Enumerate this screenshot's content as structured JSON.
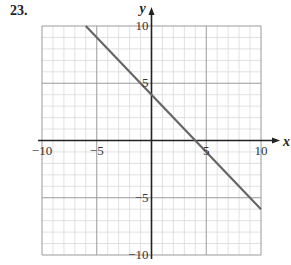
{
  "problem_number": "23.",
  "colors": {
    "minor_grid": "#d9d9d9",
    "major_grid": "#9a9a9a",
    "axis": "#222222",
    "line": "#666666"
  },
  "chart_data": {
    "type": "line",
    "title": "",
    "xlabel": "x",
    "ylabel": "y",
    "xlim": [
      -10,
      10
    ],
    "ylim": [
      -10,
      10
    ],
    "grid": true,
    "grid_minor_step": 1,
    "grid_major_step": 5,
    "x_ticks": [
      -10,
      -5,
      5,
      10
    ],
    "y_ticks": [
      -10,
      -5,
      5,
      10
    ],
    "x_tick_labels": [
      "−10",
      "−5",
      "5",
      "10"
    ],
    "y_tick_labels": [
      "−10",
      "−5",
      "5",
      "10"
    ],
    "series": [
      {
        "name": "y = -x + 4",
        "x": [
          -6,
          10
        ],
        "y": [
          10,
          -6
        ]
      }
    ]
  }
}
